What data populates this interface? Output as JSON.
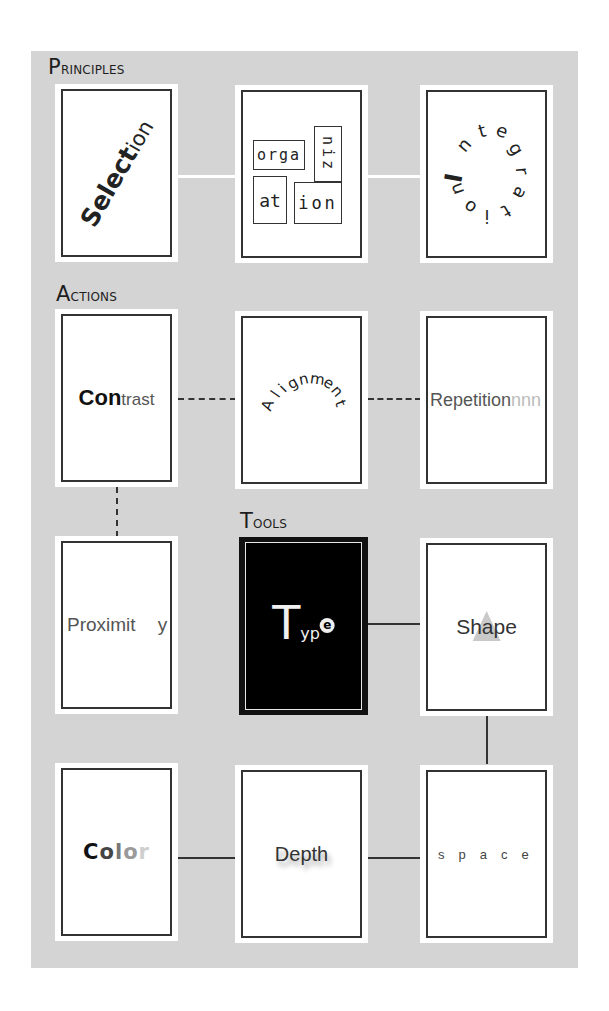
{
  "sections": {
    "principles": "Principles",
    "actions": "Actions",
    "tools": "Tools"
  },
  "colors": {
    "panel_background": "#d4d4d4",
    "card_background": "#ffffff",
    "card_border": "#333333",
    "tools_card_background": "#000000"
  },
  "cards": {
    "selection": {
      "bold": "Selec",
      "bold2": "t",
      "tail": "ion"
    },
    "organization": {
      "boxes": [
        "orga",
        "niz",
        "at",
        "ion"
      ]
    },
    "integration": {
      "letters": [
        "I",
        "n",
        "t",
        "e",
        "g",
        "r",
        "a",
        "t",
        "i",
        "o",
        "n"
      ]
    },
    "contrast": {
      "bold": "Con",
      "light": "trast"
    },
    "alignment": {
      "letters": [
        "A",
        "l",
        "i",
        "g",
        "n",
        "m",
        "e",
        "n",
        "t"
      ]
    },
    "repetition": {
      "main": "Repetition",
      "fade": "nnn"
    },
    "proximity": {
      "main": "Proximit",
      "tail": "y"
    },
    "type": {
      "big": "T",
      "rest": "yp",
      "circle": "e"
    },
    "shape": {
      "text": "Shape",
      "icon": "triangle-icon"
    },
    "color": {
      "letters": [
        "C",
        "o",
        "l",
        "o",
        "r"
      ],
      "shades": [
        "#111111",
        "#444444",
        "#777777",
        "#9a9a9a",
        "#cfcfcf"
      ]
    },
    "depth": {
      "text": "Depth"
    },
    "space": {
      "text": "space"
    }
  },
  "connectors": [
    {
      "from": "selection",
      "to": "organization",
      "style": "white-solid"
    },
    {
      "from": "organization",
      "to": "integration",
      "style": "white-solid"
    },
    {
      "from": "contrast",
      "to": "alignment",
      "style": "dashed"
    },
    {
      "from": "alignment",
      "to": "repetition",
      "style": "dashed"
    },
    {
      "from": "contrast",
      "to": "proximity",
      "style": "dashed"
    },
    {
      "from": "type",
      "to": "shape",
      "style": "solid"
    },
    {
      "from": "shape",
      "to": "space",
      "style": "solid"
    },
    {
      "from": "color",
      "to": "depth",
      "style": "solid"
    },
    {
      "from": "depth",
      "to": "space",
      "style": "solid"
    }
  ]
}
